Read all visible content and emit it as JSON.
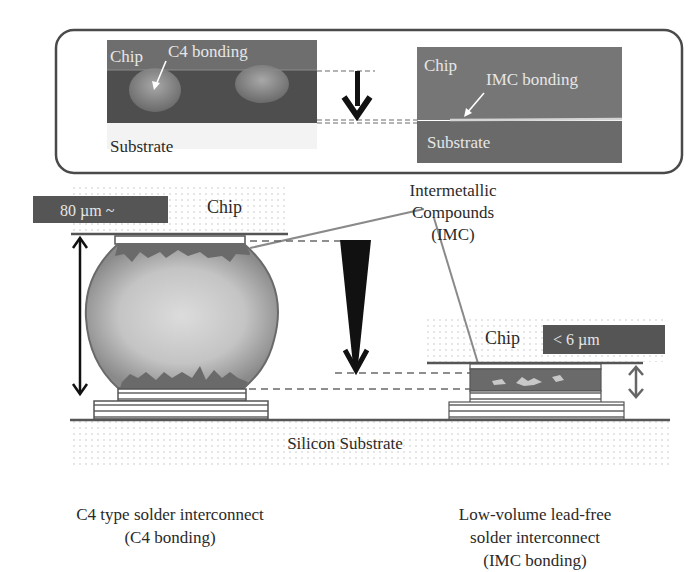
{
  "top_panel": {
    "left_micrograph": {
      "chip_label": "Chip",
      "bonding_label": "C4 bonding",
      "substrate_label": "Substrate"
    },
    "right_micrograph": {
      "chip_label": "Chip",
      "bonding_label": "IMC bonding",
      "substrate_label": "Substrate"
    }
  },
  "diagram": {
    "left": {
      "chip_label": "Chip",
      "height_badge": "80 µm ~"
    },
    "right": {
      "chip_label": "Chip",
      "height_badge": "< 6 µm"
    },
    "imc_label_line1": "Intermetallic",
    "imc_label_line2": "Compounds",
    "imc_label_line3": "(IMC)",
    "substrate_label": "Silicon Substrate"
  },
  "captions": {
    "left_line1": "C4 type solder interconnect",
    "left_line2": "(C4 bonding)",
    "right_line1": "Low-volume lead-free",
    "right_line2": "solder interconnect",
    "right_line3": "(IMC bonding)"
  },
  "colors": {
    "frame": "#4a4a4a",
    "micrograph_dark": "#5a5a5a",
    "micrograph_mid": "#6e6e6e",
    "badge": "#555555",
    "imc": "#6a6a6a",
    "solder_light": "#d8d8d8",
    "solder_edge": "#7a7a7a"
  }
}
